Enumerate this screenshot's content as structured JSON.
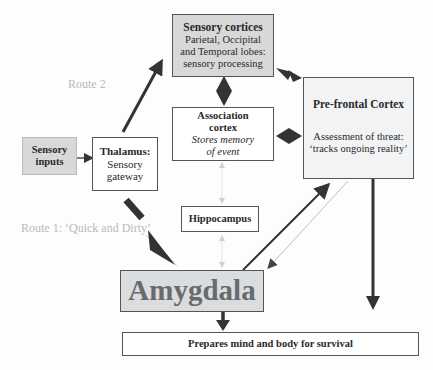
{
  "diagram": {
    "nodes": {
      "sensory_cortices": {
        "title": "Sensory cortices",
        "line1": "Parietal, Occipital",
        "line2": "and Temporal lobes:",
        "line3": "sensory processing"
      },
      "sensory_inputs": {
        "line1": "Sensory",
        "line2": "inputs"
      },
      "thalamus": {
        "title": "Thalamus:",
        "line1": "Sensory",
        "line2": "gateway"
      },
      "association_cortex": {
        "title1": "Association",
        "title2": "cortex",
        "line1": "Stores memory",
        "line2": "of event"
      },
      "prefrontal_cortex": {
        "title": "Pre-frontal Cortex",
        "line1": "Assessment of threat:",
        "line2": "‘tracks ongoing reality’"
      },
      "hippocampus": {
        "title": "Hippocampus"
      },
      "amygdala": {
        "title": "Amygdala"
      },
      "outcome": {
        "title": "Prepares mind and body for survival"
      }
    },
    "labels": {
      "route2": "Route 2",
      "route1": "Route 1: ‘Quick and Dirty’"
    },
    "edges": [
      {
        "from": "sensory_inputs",
        "to": "thalamus",
        "style": "thin arrow"
      },
      {
        "from": "thalamus",
        "to": "sensory_cortices",
        "style": "thick arrow",
        "label": "Route 2"
      },
      {
        "from": "thalamus",
        "to": "amygdala",
        "style": "thick arrow",
        "label": "Route 1: ‘Quick and Dirty’"
      },
      {
        "from": "sensory_cortices",
        "to": "association_cortex",
        "style": "bidirectional diamond"
      },
      {
        "from": "sensory_cortices",
        "to": "prefrontal_cortex",
        "style": "bidirectional"
      },
      {
        "from": "association_cortex",
        "to": "prefrontal_cortex",
        "style": "bidirectional diamond"
      },
      {
        "from": "association_cortex",
        "to": "hippocampus",
        "style": "faint bidirectional"
      },
      {
        "from": "hippocampus",
        "to": "amygdala",
        "style": "faint bidirectional"
      },
      {
        "from": "amygdala",
        "to": "prefrontal_cortex",
        "style": "thick arrow"
      },
      {
        "from": "prefrontal_cortex",
        "to": "amygdala",
        "style": "faint thin arrow"
      },
      {
        "from": "prefrontal_cortex",
        "to": "outcome",
        "style": "thick arrow"
      },
      {
        "from": "amygdala",
        "to": "outcome",
        "style": "thick arrow"
      }
    ],
    "colors": {
      "gray_box": "#d8d8d8",
      "light_box": "#f2f3f4",
      "arrow": "#333333",
      "faint": "#c0c0c0"
    }
  }
}
